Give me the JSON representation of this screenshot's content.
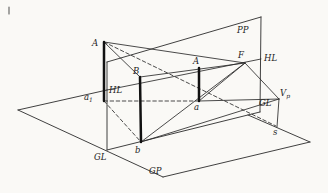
{
  "figure": {
    "width": 328,
    "height": 193,
    "colors": {
      "background": "#faf9f6",
      "line": "#2b2b2b",
      "thick_line": "#111111",
      "stray_mark": "#6a6a6a"
    },
    "label_font_size": 8.5,
    "subscript_font_size": 6,
    "labels": [
      {
        "id": "pp",
        "text": "PP",
        "sub": "",
        "x": 237,
        "y": 33
      },
      {
        "id": "hl-right",
        "text": "HL",
        "sub": "",
        "x": 264,
        "y": 61
      },
      {
        "id": "f",
        "text": "F",
        "sub": "",
        "x": 238,
        "y": 58
      },
      {
        "id": "a-image",
        "text": "A",
        "sub": "",
        "x": 193,
        "y": 64
      },
      {
        "id": "a-object",
        "text": "A",
        "sub": "",
        "x": 92,
        "y": 46
      },
      {
        "id": "b-object",
        "text": "B",
        "sub": "",
        "x": 133,
        "y": 74
      },
      {
        "id": "hl-left",
        "text": "HL",
        "sub": "",
        "x": 109,
        "y": 93
      },
      {
        "id": "a1",
        "text": "a",
        "sub": "1",
        "x": 84,
        "y": 100
      },
      {
        "id": "a-lower",
        "text": "a",
        "sub": "",
        "x": 194,
        "y": 110
      },
      {
        "id": "gl-right",
        "text": "GL",
        "sub": "",
        "x": 259,
        "y": 106
      },
      {
        "id": "vp",
        "text": "V",
        "sub": "p",
        "x": 280,
        "y": 96
      },
      {
        "id": "s",
        "text": "s",
        "sub": "",
        "x": 273,
        "y": 135
      },
      {
        "id": "gl-left",
        "text": "GL",
        "sub": "",
        "x": 94,
        "y": 160
      },
      {
        "id": "gp",
        "text": "GP",
        "sub": "",
        "x": 149,
        "y": 174
      },
      {
        "id": "b-lower",
        "text": "b",
        "sub": "",
        "x": 135,
        "y": 153
      }
    ],
    "plane_edges": [
      {
        "id": "pp-top-edge",
        "pts": [
          107,
          62,
          261,
          17
        ]
      },
      {
        "id": "pp-right-edge",
        "pts": [
          261,
          17,
          260,
          112
        ]
      },
      {
        "id": "pp-left-edge",
        "pts": [
          107,
          62,
          107,
          150
        ]
      },
      {
        "id": "pp-bottom-edge-gl",
        "pts": [
          107,
          150,
          260,
          112
        ]
      },
      {
        "id": "gp-front-left-edge",
        "pts": [
          18,
          110,
          163,
          177
        ]
      },
      {
        "id": "gp-front-right-edge",
        "pts": [
          163,
          177,
          310,
          142
        ]
      },
      {
        "id": "gp-back-left-edge",
        "pts": [
          18,
          110,
          107,
          90
        ]
      },
      {
        "id": "gp-back-right-edge",
        "pts": [
          310,
          142,
          248,
          115
        ]
      }
    ],
    "construction_lines": [
      {
        "id": "line-A-to-B",
        "pts": [
          104,
          42,
          140,
          77
        ]
      },
      {
        "id": "line-A-to-F",
        "pts": [
          104,
          42,
          245,
          63
        ]
      },
      {
        "id": "horizon-line-hl",
        "pts": [
          107,
          90,
          261,
          59
        ]
      },
      {
        "id": "line-B-to-F",
        "pts": [
          140,
          77,
          245,
          63
        ]
      },
      {
        "id": "line-a-to-F",
        "pts": [
          199,
          101,
          245,
          63
        ]
      },
      {
        "id": "line-b-to-F",
        "pts": [
          141,
          142,
          245,
          63
        ]
      },
      {
        "id": "line-a-to-Vp",
        "pts": [
          199,
          101,
          279,
          99
        ]
      },
      {
        "id": "line-b-to-Vp",
        "pts": [
          141,
          142,
          279,
          99
        ]
      },
      {
        "id": "line-F-to-Vp",
        "pts": [
          245,
          63,
          279,
          99
        ]
      },
      {
        "id": "line-Vp-to-s",
        "pts": [
          279,
          99,
          277,
          127
        ]
      }
    ],
    "dashed_lines": [
      {
        "id": "sight-ray-A-to-s",
        "pts": [
          104,
          42,
          276,
          126
        ]
      },
      {
        "id": "dashed-a1-to-a",
        "pts": [
          104,
          101,
          199,
          101
        ]
      },
      {
        "id": "dashed-a1-to-b",
        "pts": [
          104,
          101,
          141,
          142
        ]
      }
    ],
    "thick_lines": [
      {
        "id": "object-line-A-a1",
        "pts": [
          104,
          42,
          104,
          101
        ]
      },
      {
        "id": "object-line-B-b",
        "pts": [
          140,
          77,
          141,
          142
        ]
      },
      {
        "id": "image-line-A-a",
        "pts": [
          199,
          68,
          199,
          101
        ]
      }
    ],
    "artifacts": [
      {
        "id": "stray-mark",
        "pts": [
          9,
          7,
          9,
          14
        ]
      }
    ]
  }
}
